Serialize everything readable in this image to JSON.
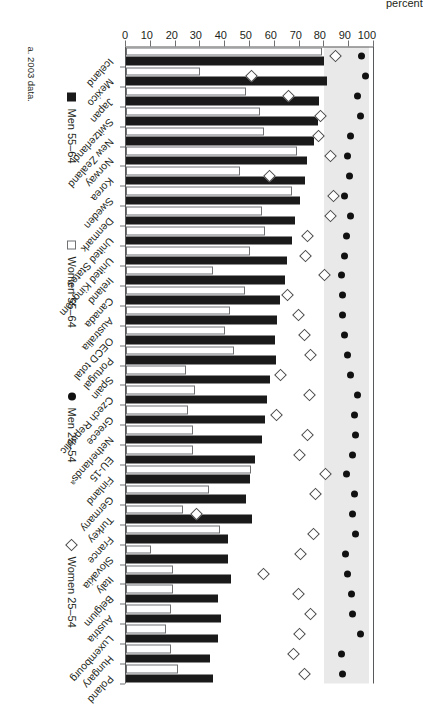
{
  "chart_data": {
    "type": "bar",
    "title": "",
    "xlabel": "",
    "ylabel": "percent",
    "ylim": [
      0,
      100
    ],
    "yticks": [
      0,
      10,
      20,
      30,
      40,
      50,
      60,
      70,
      80,
      90,
      100
    ],
    "grid": false,
    "legend_position": "bottom",
    "shaded_band": [
      80,
      98
    ],
    "categories": [
      "Iceland",
      "Mexico",
      "Japan",
      "Switzerland",
      "New Zealand",
      "Norway",
      "Korea",
      "Sweden",
      "Denmark",
      "United States",
      "United Kingdom",
      "Ireland",
      "Canada",
      "Australia",
      "OECD total",
      "Portugal",
      "Spain",
      "Czech Republic",
      "Greece",
      "Netherlandsᵃ",
      "EU-15",
      "Finland",
      "Germany",
      "Turkey",
      "France",
      "Slovakia",
      "Italy",
      "Belgium",
      "Austria",
      "Luxembourg",
      "Hungary",
      "Poland"
    ],
    "series": [
      {
        "name": "Men 55–64",
        "marker": "filled-square",
        "color": "#1a1a1a",
        "type": "bar",
        "values": [
          80,
          81,
          78,
          77.5,
          76,
          73,
          72,
          70,
          68,
          67,
          65,
          64,
          62,
          61,
          60,
          60.5,
          58,
          57,
          56,
          55,
          52,
          50,
          48.5,
          51,
          41,
          41,
          42.5,
          37,
          38.5,
          37,
          34,
          35
        ]
      },
      {
        "name": "Women 55–64",
        "marker": "open-square",
        "color": "#ffffff",
        "type": "bar",
        "values": [
          79,
          30,
          48.5,
          54,
          55.5,
          69,
          46,
          67,
          55,
          56,
          50,
          35,
          48,
          42,
          40,
          43.5,
          24,
          28,
          25,
          27,
          27,
          50.5,
          33.5,
          23,
          38,
          10,
          19,
          19,
          18,
          16,
          18,
          21
        ]
      },
      {
        "name": "Men 25–54",
        "marker": "filled-circle",
        "color": "#111111",
        "type": "point",
        "values": [
          95,
          96.5,
          93.5,
          94.5,
          90.5,
          89.5,
          90,
          88,
          90.5,
          89,
          88,
          87,
          87.5,
          87.5,
          88,
          89.5,
          90.5,
          93.5,
          92,
          92.5,
          91.5,
          89,
          92,
          91.5,
          92.5,
          88.5,
          89.5,
          91,
          91.5,
          94.5,
          87,
          87.5
        ]
      },
      {
        "name": "Women 25–54",
        "marker": "open-diamond",
        "color": "#ffffff",
        "type": "point",
        "values": [
          84.5,
          50.5,
          65.5,
          78.5,
          77.5,
          82.5,
          58,
          83.5,
          82.5,
          73,
          72.5,
          80,
          65,
          69.5,
          72,
          74.5,
          62.5,
          74,
          60.5,
          73,
          70,
          80.5,
          76.5,
          28.5,
          75.5,
          70.5,
          55.5,
          69.5,
          74.5,
          70,
          67.5,
          72
        ]
      }
    ]
  },
  "axis": {
    "ylabel": "percent",
    "tick_labels": [
      "100",
      "90",
      "80",
      "70",
      "60",
      "50",
      "40",
      "30",
      "20",
      "10",
      "0"
    ]
  },
  "legend": {
    "items": [
      {
        "label": "Men 55–64",
        "icon": "filled-square-icon"
      },
      {
        "label": "Women 55–64",
        "icon": "open-square-icon"
      },
      {
        "label": "Men 25–54",
        "icon": "filled-circle-icon"
      },
      {
        "label": "Women 25–54",
        "icon": "open-diamond-icon"
      }
    ]
  },
  "footnote": "a. 2003 data."
}
